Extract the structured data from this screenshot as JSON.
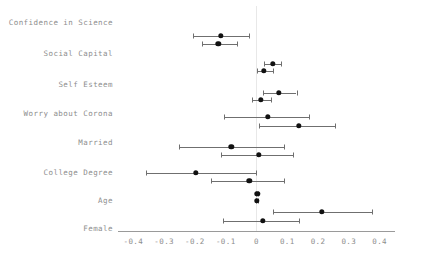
{
  "chart_data": {
    "type": "scatter",
    "title": "",
    "subtitle": "",
    "xlabel": "",
    "ylabel": "",
    "xlim": [
      -0.45,
      0.45
    ],
    "xticks": [
      -0.4,
      -0.3,
      -0.2,
      -0.1,
      0,
      0.1,
      0.2,
      0.3,
      0.4
    ],
    "xtick_labels": [
      "-0.4",
      "-0.3",
      "-0.2",
      "-0.1",
      "0",
      "0.1",
      "0.2",
      "0.3",
      "0.4"
    ],
    "grid": false,
    "legend": null,
    "reference_line_x": 0,
    "categories": [
      "Confidence in Science",
      "Social Capital",
      "Self Esteem",
      "Worry about Corona",
      "Married",
      "College Degree",
      "Age",
      "Female"
    ],
    "series": [
      {
        "name": "Model 1",
        "estimates": [
          -0.115,
          0.052,
          0.073,
          0.037,
          -0.082,
          -0.197,
          0.002,
          0.213
        ],
        "ci_low": [
          -0.206,
          0.025,
          0.02,
          -0.105,
          -0.253,
          -0.36,
          -0.002,
          0.053
        ],
        "ci_high": [
          -0.023,
          0.08,
          0.13,
          0.17,
          0.09,
          -0.002,
          0.006,
          0.375
        ]
      },
      {
        "name": "Model 2",
        "estimates": [
          -0.124,
          0.023,
          0.013,
          0.138,
          0.008,
          -0.024,
          0.001,
          0.02
        ]
      }
    ],
    "rows": [
      {
        "label": "Confidence in Science",
        "upper": {
          "estimate": -0.115,
          "ci_low": -0.206,
          "ci_high": -0.023
        },
        "lower": {
          "estimate": -0.124,
          "ci_low": -0.178,
          "ci_high": -0.062
        }
      },
      {
        "label": "Social Capital",
        "upper": {
          "estimate": 0.052,
          "ci_low": 0.025,
          "ci_high": 0.08
        },
        "lower": {
          "estimate": 0.023,
          "ci_low": 0.002,
          "ci_high": 0.055
        }
      },
      {
        "label": "Self Esteem",
        "upper": {
          "estimate": 0.073,
          "ci_low": 0.02,
          "ci_high": 0.13
        },
        "lower": {
          "estimate": 0.013,
          "ci_low": -0.015,
          "ci_high": 0.048
        }
      },
      {
        "label": "Worry about Corona",
        "upper": {
          "estimate": 0.037,
          "ci_low": -0.105,
          "ci_high": 0.17
        },
        "lower": {
          "estimate": 0.138,
          "ci_low": 0.008,
          "ci_high": 0.255
        }
      },
      {
        "label": "Married",
        "upper": {
          "estimate": -0.082,
          "ci_low": -0.253,
          "ci_high": 0.09
        },
        "lower": {
          "estimate": 0.008,
          "ci_low": -0.115,
          "ci_high": 0.12
        }
      },
      {
        "label": "College Degree",
        "upper": {
          "estimate": -0.197,
          "ci_low": -0.36,
          "ci_high": -0.002
        },
        "lower": {
          "estimate": -0.024,
          "ci_low": -0.147,
          "ci_high": 0.09
        }
      },
      {
        "label": "Age",
        "upper": {
          "estimate": 0.002,
          "ci_low": -0.002,
          "ci_high": 0.006
        },
        "lower": {
          "estimate": 0.001,
          "ci_low": -0.003,
          "ci_high": 0.005
        }
      },
      {
        "label": "Female",
        "upper": {
          "estimate": 0.213,
          "ci_low": 0.053,
          "ci_high": 0.375
        },
        "lower": {
          "estimate": 0.02,
          "ci_low": -0.108,
          "ci_high": 0.137
        }
      }
    ]
  }
}
